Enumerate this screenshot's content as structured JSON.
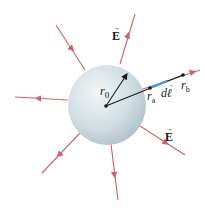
{
  "figure": {
    "labels": {
      "field_top": "E",
      "field_right": "E",
      "radius": "r",
      "radius_sub": "0",
      "ra": "r",
      "ra_sub": "a",
      "rb": "r",
      "rb_sub": "b",
      "dl": "d",
      "dl_sym": "ℓ"
    },
    "colors": {
      "field_line": "#d0606a",
      "sphere_light": "#eef3f5",
      "sphere_dark": "#a9bcc4",
      "radius_vector": "#1a1a1a",
      "dl_segment": "#3aa0d8"
    }
  }
}
